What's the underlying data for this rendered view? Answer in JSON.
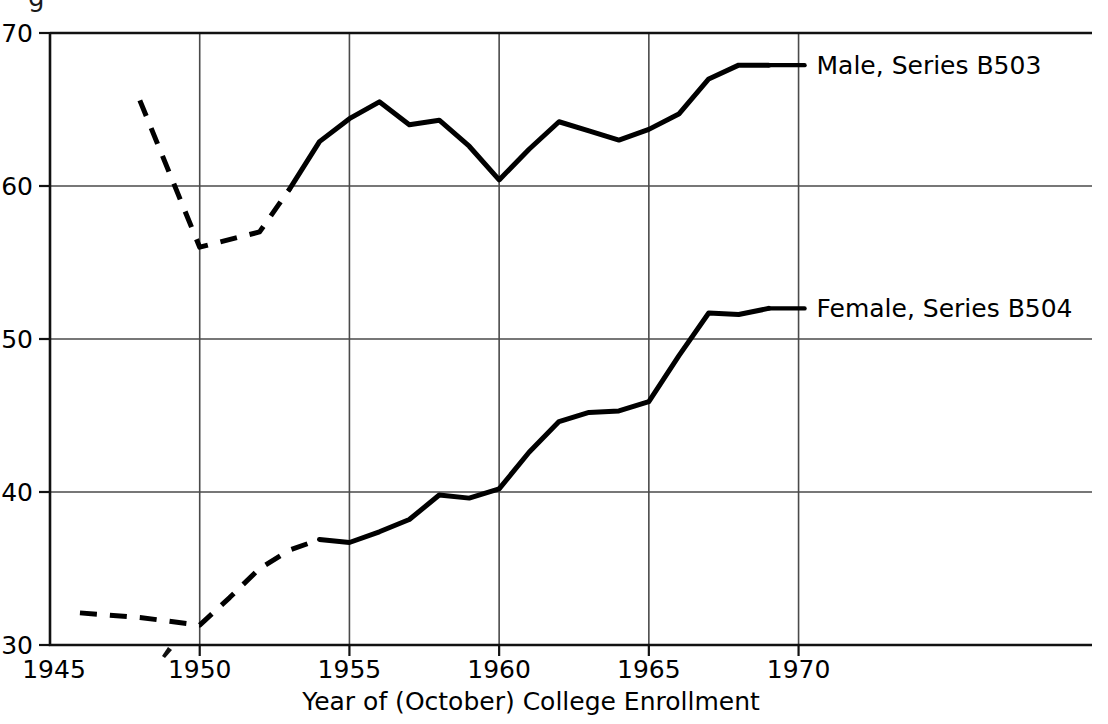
{
  "figure": {
    "caption_fragment": "g",
    "partial_caption_note": "cut-off descender of figure caption above chart"
  },
  "chart_data": {
    "type": "line",
    "title": "",
    "xlabel": "Year of (October) College Enrollment",
    "ylabel": "",
    "xlim": [
      1945,
      1979.8
    ],
    "ylim": [
      30,
      70
    ],
    "grid": true,
    "legend_position": "inline-right-of-line-end",
    "x_ticks": [
      "1945",
      "1950",
      "1955",
      "1960",
      "1965",
      "1970"
    ],
    "x_tick_values": [
      1945,
      1950,
      1955,
      1960,
      1965,
      1970
    ],
    "y_ticks": [
      "30",
      "40",
      "50",
      "60",
      "70"
    ],
    "y_tick_values": [
      30,
      40,
      50,
      60,
      70
    ],
    "series": [
      {
        "name": "Male, Series B503",
        "label": "Male, Series B503",
        "style": "solid-with-dashed-early-segment",
        "dashed_until_x": 1953,
        "x": [
          1948,
          1950,
          1952,
          1953,
          1954,
          1955,
          1956,
          1957,
          1958,
          1959,
          1960,
          1961,
          1962,
          1963,
          1964,
          1965,
          1966,
          1967,
          1968,
          1969
        ],
        "values": [
          65.6,
          56.0,
          57.0,
          59.8,
          62.9,
          64.4,
          65.5,
          64.0,
          64.3,
          62.6,
          60.4,
          62.4,
          64.2,
          63.6,
          63.0,
          63.7,
          64.7,
          67.0,
          67.9,
          67.9
        ]
      },
      {
        "name": "Female, Series B504",
        "label": "Female, Series B504",
        "style": "solid-with-dashed-early-segment",
        "dashed_until_x": 1954,
        "x": [
          1946,
          1948,
          1950,
          1951,
          1952,
          1953,
          1954,
          1955,
          1956,
          1957,
          1958,
          1959,
          1960,
          1961,
          1962,
          1963,
          1964,
          1965,
          1966,
          1967,
          1968,
          1969
        ],
        "values": [
          32.1,
          31.8,
          31.3,
          33.1,
          35.0,
          36.2,
          36.9,
          36.7,
          37.4,
          38.2,
          39.8,
          39.6,
          40.2,
          42.6,
          44.6,
          45.2,
          45.3,
          45.9,
          48.9,
          51.7,
          51.6,
          52.0
        ]
      }
    ],
    "annotations": [
      {
        "text": "Male, Series B503",
        "x": 1970.6,
        "y": 67.9
      },
      {
        "text": "Female, Series B504",
        "x": 1970.6,
        "y": 52.0
      }
    ]
  }
}
